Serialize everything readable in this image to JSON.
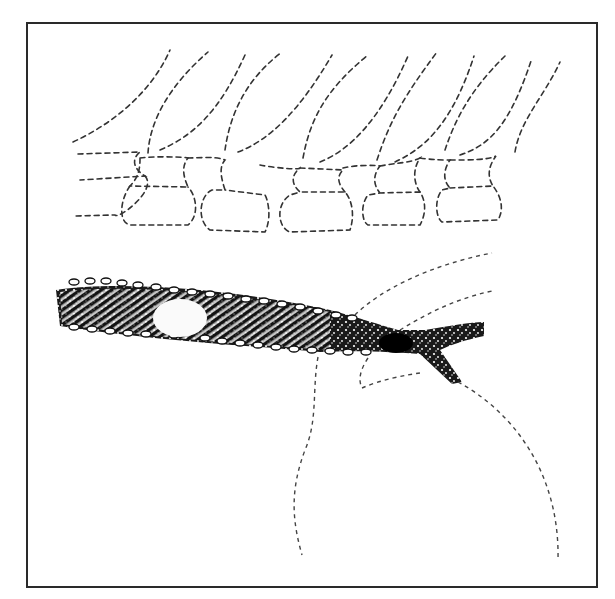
{
  "figure": {
    "description": "Lateral schematic line drawing: dashed outlines of spinal vertebrae above a stippled tubular structure with a clear oval lesion and a dark solid mass near a bifurcation, with a dashed rounded organ outline below",
    "labels": [],
    "colors": {
      "ink": "#1a1a1a",
      "dashed_outline": "#333333",
      "frame": "#2a2a2a",
      "background": "#ffffff"
    },
    "elements": {
      "vertebrae_count": 6,
      "tube_lesions": [
        "clear-oval-lesion",
        "dark-solid-mass"
      ],
      "structures": [
        "vertebral-column-outline",
        "stippled-tube",
        "branch-bifurcation",
        "rounded-organ-outline"
      ]
    }
  }
}
